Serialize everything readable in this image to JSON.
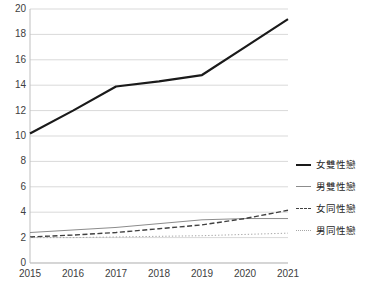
{
  "chart_data": {
    "type": "line",
    "title": "",
    "subtitle": "",
    "xlabel": "",
    "ylabel": "",
    "categories": [
      "2015",
      "2016",
      "2017",
      "2018",
      "2019",
      "2020",
      "2021"
    ],
    "x": [
      2015,
      2016,
      2017,
      2018,
      2019,
      2020,
      2021
    ],
    "xlim": [
      2015,
      2021
    ],
    "ylim": [
      0,
      20
    ],
    "y_ticks": [
      0,
      2,
      4,
      6,
      8,
      10,
      12,
      14,
      16,
      18,
      20
    ],
    "grid": "horizontal",
    "legend_position": "right",
    "series": [
      {
        "name": "女雙性戀",
        "style": "solid-thick",
        "color": "#1a1a1a",
        "width": 2.2,
        "values": [
          10.2,
          12.0,
          13.9,
          14.3,
          14.8,
          17.0,
          19.2
        ]
      },
      {
        "name": "男雙性戀",
        "style": "solid-thin",
        "color": "#8c8c8c",
        "width": 1.0,
        "values": [
          2.4,
          2.6,
          2.8,
          3.1,
          3.4,
          3.5,
          3.5
        ]
      },
      {
        "name": "女同性戀",
        "style": "dashed",
        "color": "#404040",
        "width": 1.4,
        "values": [
          2.05,
          2.2,
          2.4,
          2.7,
          3.0,
          3.5,
          4.15
        ]
      },
      {
        "name": "男同性戀",
        "style": "dotted",
        "color": "#a6a6a6",
        "width": 1.0,
        "values": [
          2.0,
          2.0,
          2.05,
          2.1,
          2.15,
          2.25,
          2.35
        ]
      }
    ]
  },
  "legend": {
    "items": [
      {
        "label": "女雙性戀",
        "style": "solid-thick",
        "color": "#1a1a1a"
      },
      {
        "label": "男雙性戀",
        "style": "solid-thin",
        "color": "#8c8c8c"
      },
      {
        "label": "女同性戀",
        "style": "dashed",
        "color": "#404040"
      },
      {
        "label": "男同性戀",
        "style": "dotted",
        "color": "#a6a6a6"
      }
    ]
  },
  "axes": {
    "y_tick_labels": [
      "20",
      "18",
      "16",
      "14",
      "12",
      "10",
      "8",
      "6",
      "4",
      "2",
      "0"
    ],
    "x_tick_labels": [
      "2015",
      "2016",
      "2017",
      "2018",
      "2019",
      "2020",
      "2021"
    ],
    "gridline_color": "#d9d9d9",
    "axis_line_color": "#bfbfbf"
  }
}
